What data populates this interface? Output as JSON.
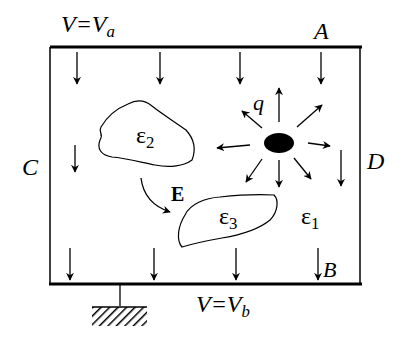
{
  "figure": {
    "colors": {
      "ink": "#000000",
      "background": "#ffffff"
    },
    "labels": {
      "top_potential": {
        "main": "V=V",
        "sub": "a"
      },
      "bottom_potential": {
        "main": "V=V",
        "sub": "b"
      },
      "point_A": "A",
      "point_B": "B",
      "point_C": "C",
      "point_D": "D",
      "charge": "q",
      "field": "E",
      "eps1": {
        "main": "ε",
        "sub": "1"
      },
      "eps2": {
        "main": "ε",
        "sub": "2"
      },
      "eps3": {
        "main": "ε",
        "sub": "3"
      }
    },
    "elements": {
      "top_electrode": "conductor at potential Va",
      "bottom_electrode": "conductor at potential Vb, grounded",
      "ground_symbol": "hatched ground",
      "charge_arrows": 9,
      "field_arrows_top": 4,
      "field_arrows_middle": 2,
      "field_arrows_bottom": 4
    }
  }
}
